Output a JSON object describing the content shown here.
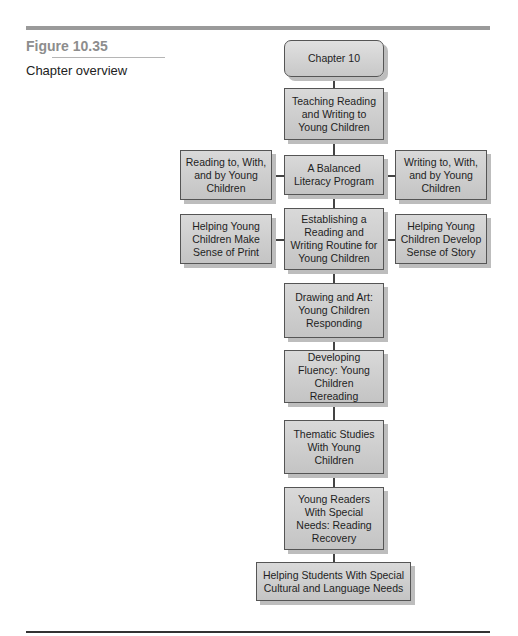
{
  "figure": {
    "label": "Figure 10.35",
    "caption": "Chapter overview"
  },
  "diagram": {
    "root": "Chapter 10",
    "spine": [
      "Teaching Reading and Writing to Young Children",
      "A Balanced Literacy Program",
      "Establishing a Reading and Writing Routine for Young Children",
      "Drawing and Art: Young Children Responding",
      "Developing Fluency: Young Children Rereading",
      "Thematic Studies With Young Children",
      "Young Readers With Special Needs: Reading Recovery",
      "Helping Students With Special Cultural and Language Needs"
    ],
    "branches": {
      "balanced_left": "Reading to, With, and by Young Children",
      "balanced_right": "Writing to, With, and by Young Children",
      "routine_left": "Helping Young Children Make Sense of Print",
      "routine_right": "Helping Young Children Develop Sense of Story"
    }
  }
}
